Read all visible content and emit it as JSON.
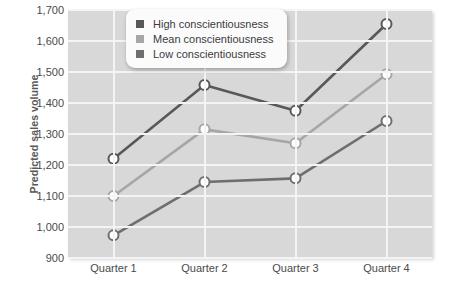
{
  "chart_data": {
    "type": "line",
    "title": "",
    "xlabel": "",
    "ylabel": "Predicted sales volume",
    "categories": [
      "Quarter 1",
      "Quarter 2",
      "Quarter 3",
      "Quarter 4"
    ],
    "ylim": [
      900,
      1700
    ],
    "yticks": [
      "900",
      "1,000",
      "1,100",
      "1,200",
      "1,300",
      "1,400",
      "1,500",
      "1,600",
      "1,700"
    ],
    "ytick_values": [
      900,
      1000,
      1100,
      1200,
      1300,
      1400,
      1500,
      1600,
      1700
    ],
    "grid": true,
    "legend_position": "top-left-inside",
    "series": [
      {
        "name": "High conscientiousness",
        "color": "#585858",
        "values": [
          1220,
          1458,
          1375,
          1655
        ]
      },
      {
        "name": "Mean conscientiousness",
        "color": "#a6a6a6",
        "values": [
          1100,
          1315,
          1270,
          1493
        ]
      },
      {
        "name": "Low conscientiousness",
        "color": "#6e6e6e",
        "values": [
          973,
          1145,
          1157,
          1342
        ]
      }
    ],
    "marker": {
      "shape": "circle",
      "fill": "#ffffff",
      "outline_width": 2
    },
    "plot_background": "#d8d8d8",
    "gridline_color": "#f4f4f4"
  }
}
